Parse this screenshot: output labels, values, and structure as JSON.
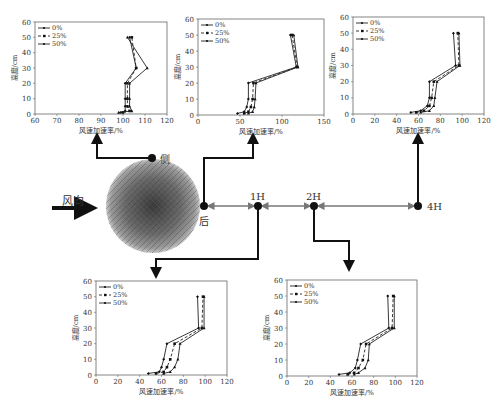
{
  "diagram": {
    "wind_label": "风向",
    "nodes": {
      "side": "侧",
      "back": "后",
      "h1": "1H",
      "h2": "2H",
      "h4": "4H"
    }
  },
  "legend": [
    "0%",
    "25%",
    "50%"
  ],
  "xlabel": "风速加速率/%",
  "ylabel": "高度/cm",
  "chart_data": [
    {
      "id": "side",
      "type": "line",
      "position": "侧",
      "xlabel": "风速加速率/%",
      "ylabel": "高度/cm",
      "xlim": [
        60,
        120
      ],
      "xticks": [
        60,
        70,
        80,
        90,
        100,
        110,
        120
      ],
      "ylim": [
        0,
        60
      ],
      "yticks": [
        0,
        10,
        20,
        30,
        40,
        50,
        60
      ],
      "y": [
        1,
        2,
        5,
        10,
        20,
        30,
        50
      ],
      "series": [
        {
          "name": "0%",
          "values": [
            99,
            101,
            101,
            101,
            101,
            106,
            103
          ]
        },
        {
          "name": "25%",
          "values": [
            100,
            103,
            102,
            102,
            102,
            106,
            104
          ]
        },
        {
          "name": "50%",
          "values": [
            98,
            104,
            103,
            103,
            103,
            111,
            102
          ]
        }
      ]
    },
    {
      "id": "back",
      "type": "line",
      "position": "后",
      "xlabel": "风速加速率/%",
      "ylabel": "高度/cm",
      "xlim": [
        0,
        150
      ],
      "xticks": [
        0,
        50,
        100,
        150
      ],
      "ylim": [
        0,
        60
      ],
      "yticks": [
        0,
        10,
        20,
        30,
        40,
        50,
        60
      ],
      "y": [
        1,
        2,
        5,
        10,
        20,
        30,
        50
      ],
      "series": [
        {
          "name": "0%",
          "values": [
            47,
            55,
            58,
            60,
            60,
            117,
            110
          ]
        },
        {
          "name": "25%",
          "values": [
            55,
            60,
            63,
            65,
            66,
            118,
            112
          ]
        },
        {
          "name": "50%",
          "values": [
            60,
            65,
            67,
            68,
            69,
            119,
            114
          ]
        }
      ]
    },
    {
      "id": "4H",
      "type": "line",
      "position": "4H",
      "xlabel": "风速加速率/%",
      "ylabel": "高度/cm",
      "xlim": [
        0,
        120
      ],
      "xticks": [
        0,
        20,
        40,
        60,
        80,
        100,
        120
      ],
      "ylim": [
        0,
        60
      ],
      "yticks": [
        0,
        10,
        20,
        30,
        40,
        50,
        60
      ],
      "y": [
        1,
        2,
        5,
        10,
        20,
        30,
        50
      ],
      "series": [
        {
          "name": "0%",
          "values": [
            53,
            62,
            68,
            70,
            70,
            94,
            92
          ]
        },
        {
          "name": "25%",
          "values": [
            58,
            65,
            70,
            72,
            74,
            97,
            96
          ]
        },
        {
          "name": "50%",
          "values": [
            62,
            70,
            74,
            75,
            77,
            98,
            97
          ]
        }
      ]
    },
    {
      "id": "1H",
      "type": "line",
      "position": "1H",
      "xlabel": "风速加速率/%",
      "ylabel": "高度/cm",
      "xlim": [
        0,
        120
      ],
      "xticks": [
        0,
        20,
        40,
        60,
        80,
        100,
        120
      ],
      "ylim": [
        0,
        60
      ],
      "yticks": [
        0,
        10,
        20,
        30,
        40,
        50,
        60
      ],
      "y": [
        1,
        2,
        5,
        10,
        20,
        30,
        50
      ],
      "series": [
        {
          "name": "0%",
          "values": [
            48,
            58,
            60,
            62,
            65,
            94,
            93
          ]
        },
        {
          "name": "25%",
          "values": [
            55,
            62,
            65,
            68,
            72,
            97,
            98
          ]
        },
        {
          "name": "50%",
          "values": [
            62,
            68,
            72,
            75,
            77,
            99,
            99
          ]
        }
      ]
    },
    {
      "id": "2H",
      "type": "line",
      "position": "2H",
      "xlabel": "风速加速率/%",
      "ylabel": "高度/cm",
      "xlim": [
        0,
        120
      ],
      "xticks": [
        0,
        20,
        40,
        60,
        80,
        100,
        120
      ],
      "ylim": [
        0,
        60
      ],
      "yticks": [
        0,
        10,
        20,
        30,
        40,
        50,
        60
      ],
      "y": [
        1,
        2,
        5,
        10,
        20,
        30,
        50
      ],
      "series": [
        {
          "name": "0%",
          "values": [
            48,
            58,
            63,
            65,
            68,
            94,
            93
          ]
        },
        {
          "name": "25%",
          "values": [
            56,
            62,
            66,
            70,
            73,
            97,
            98
          ]
        },
        {
          "name": "50%",
          "values": [
            62,
            66,
            72,
            75,
            76,
            99,
            99
          ]
        }
      ]
    }
  ]
}
